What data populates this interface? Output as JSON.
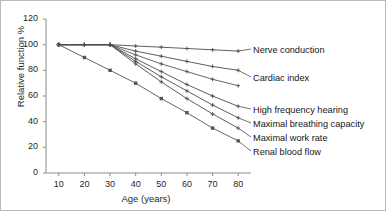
{
  "chart_data": {
    "type": "line",
    "title": "",
    "xlabel": "Age (years)",
    "ylabel": "Relative function %",
    "xlim": [
      5,
      85
    ],
    "ylim": [
      0,
      120
    ],
    "xticks": [
      10,
      20,
      30,
      40,
      50,
      60,
      70,
      80
    ],
    "yticks": [
      0,
      20,
      40,
      60,
      80,
      100,
      120
    ],
    "grid": false,
    "legend_position": "right-inline-labels",
    "x": [
      10,
      20,
      30,
      40,
      50,
      60,
      70,
      80
    ],
    "series": [
      {
        "name": "Nerve conduction",
        "label": "Nerve conduction",
        "values": [
          100,
          100,
          100,
          99,
          98,
          97,
          96,
          95
        ],
        "marker": "cross",
        "color": "#4d4d4d"
      },
      {
        "name": "Cardiac index",
        "label": "Cardiac index",
        "values": [
          100,
          100,
          100,
          95,
          91,
          87,
          83,
          80
        ],
        "marker": "cross",
        "color": "#4d4d4d"
      },
      {
        "name": "Unlabelled intermediate curve",
        "label": "",
        "values": [
          100,
          100,
          100,
          92,
          85,
          79,
          73,
          68
        ],
        "marker": "cross",
        "color": "#555555"
      },
      {
        "name": "High frequency hearing",
        "label": "High frequency hearing",
        "values": [
          100,
          100,
          100,
          89,
          79,
          69,
          60,
          52
        ],
        "marker": "cross",
        "color": "#4d4d4d"
      },
      {
        "name": "Maximal breathing capacity",
        "label": "Maximal breathing capacity",
        "values": [
          100,
          100,
          100,
          87,
          75,
          64,
          53,
          43
        ],
        "marker": "cross",
        "color": "#4d4d4d"
      },
      {
        "name": "Maximal work rate",
        "label": "Maximal work rate",
        "values": [
          100,
          100,
          100,
          85,
          71,
          58,
          46,
          35
        ],
        "marker": "cross",
        "color": "#4d4d4d"
      },
      {
        "name": "Renal blood flow",
        "label": "Renal blood flow",
        "values": [
          100,
          90,
          80,
          70,
          58,
          47,
          35,
          25
        ],
        "marker": "square",
        "color": "#555555"
      }
    ]
  },
  "axes": {
    "y_tick_labels": [
      "120",
      "100",
      "80",
      "60",
      "40",
      "20",
      "0"
    ],
    "x_tick_labels": [
      "10",
      "20",
      "30",
      "40",
      "50",
      "60",
      "70",
      "80"
    ],
    "x_title": "Age (years)",
    "y_title": "Relative function %"
  },
  "labels": {
    "nerve_conduction": "Nerve conduction",
    "cardiac_index": "Cardiac index",
    "high_frequency_hearing": "High frequency hearing",
    "maximal_breathing_capacity": "Maximal breathing capacity",
    "maximal_work_rate": "Maximal work rate",
    "renal_blood_flow": "Renal blood flow"
  },
  "colors": {
    "line": "#4d4d4d",
    "axis": "#8c8c8c",
    "text": "#1a1a1a",
    "background": "#ffffff",
    "border": "#b9b9b9"
  }
}
